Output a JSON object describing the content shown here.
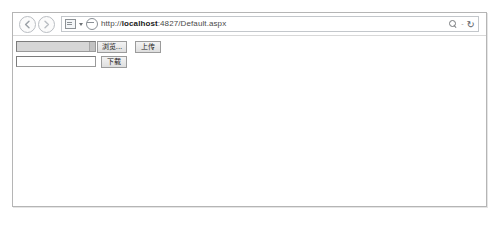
{
  "browser": {
    "nav": {
      "back_label": "Back",
      "forward_label": "Forward"
    },
    "address_bar": {
      "url_scheme": "http://",
      "url_host": "localhost",
      "url_rest": ":4827/Default.aspx",
      "url_full": "http://localhost:4827/Default.aspx",
      "compatibility_icon": "compatibility-view-icon",
      "site_icon": "page-favicon",
      "search_icon": "search-icon",
      "separator": "-",
      "refresh_icon": "refresh-icon",
      "refresh_glyph": "↻"
    }
  },
  "page": {
    "upload_row": {
      "file_input_value": "",
      "file_input_placeholder": "",
      "browse_button_label": "浏览...",
      "upload_button_label": "上传"
    },
    "download_row": {
      "text_input_value": "",
      "text_input_placeholder": "",
      "download_button_label": "下载"
    }
  },
  "colors": {
    "frame_border": "#b5b5b5",
    "page_background": "#ffffff",
    "button_face": "#dedede",
    "disabled_field": "#d6d6d6"
  }
}
